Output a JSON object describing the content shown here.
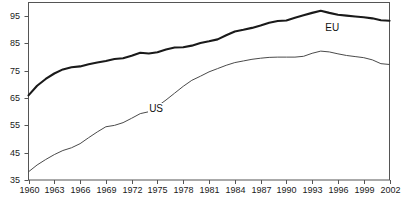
{
  "chart_data": {
    "type": "line",
    "title": "",
    "subtitle": "",
    "xlabel": "",
    "ylabel": "",
    "xlim": [
      1960,
      2002
    ],
    "ylim": [
      35,
      100
    ],
    "grid": false,
    "legend_position": "inline-annotation",
    "y_ticks": [
      35,
      45,
      55,
      65,
      75,
      85,
      95
    ],
    "y_tick_labels": [
      "35",
      "45",
      "55",
      "65",
      "75",
      "85",
      "95"
    ],
    "x_ticks": [
      1960,
      1963,
      1966,
      1969,
      1972,
      1975,
      1978,
      1981,
      1984,
      1987,
      1990,
      1993,
      1996,
      1999,
      2002
    ],
    "x_tick_labels": [
      "1960",
      "1963",
      "1966",
      "1969",
      "1972",
      "1975",
      "1978",
      "1981",
      "1984",
      "1987",
      "1990",
      "1993",
      "1996",
      "1999",
      "2002"
    ],
    "x": [
      1960,
      1961,
      1962,
      1963,
      1964,
      1965,
      1966,
      1967,
      1968,
      1969,
      1970,
      1971,
      1972,
      1973,
      1974,
      1975,
      1976,
      1977,
      1978,
      1979,
      1980,
      1981,
      1982,
      1983,
      1984,
      1985,
      1986,
      1987,
      1988,
      1989,
      1990,
      1991,
      1992,
      1993,
      1994,
      1995,
      1996,
      1997,
      1998,
      1999,
      2000,
      2001,
      2002
    ],
    "series": [
      {
        "name": "EU",
        "annotation": "EU",
        "color": "#1a1a1a",
        "line_width": 2.1,
        "values": [
          66.0,
          69.5,
          72.0,
          74.0,
          75.5,
          76.3,
          76.6,
          77.4,
          78.0,
          78.6,
          79.3,
          79.6,
          80.5,
          81.6,
          81.3,
          81.8,
          82.8,
          83.5,
          83.6,
          84.2,
          85.2,
          85.8,
          86.5,
          88.0,
          89.4,
          90.0,
          90.7,
          91.6,
          92.6,
          93.2,
          93.4,
          94.4,
          95.3,
          96.2,
          97.0,
          96.2,
          95.5,
          95.2,
          94.9,
          94.6,
          94.2,
          93.5,
          93.3
        ]
      },
      {
        "name": "US",
        "annotation": "US",
        "color": "#4a4a4a",
        "line_width": 1.0,
        "values": [
          38.0,
          40.5,
          42.5,
          44.3,
          45.8,
          46.8,
          48.3,
          50.5,
          52.6,
          54.5,
          55.0,
          56.0,
          57.6,
          59.3,
          60.0,
          62.0,
          64.3,
          66.8,
          69.3,
          71.5,
          73.0,
          74.6,
          75.8,
          77.0,
          78.0,
          78.6,
          79.2,
          79.6,
          79.9,
          80.0,
          80.0,
          80.0,
          80.3,
          81.4,
          82.2,
          81.9,
          81.2,
          80.6,
          80.2,
          79.8,
          79.0,
          77.6,
          77.3
        ]
      }
    ]
  },
  "annotations": {
    "eu_label": "EU",
    "us_label": "US"
  },
  "axes": {
    "frame_color": "#555555",
    "tick_color": "#555555"
  }
}
